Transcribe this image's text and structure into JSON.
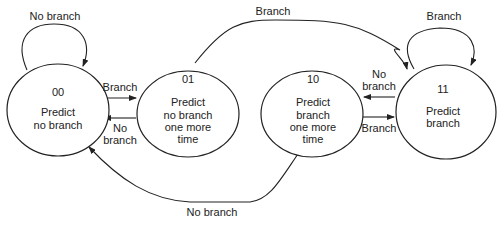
{
  "diagram": {
    "states": [
      {
        "id": "s00",
        "code": "00",
        "lines": [
          "Predict",
          "no branch"
        ]
      },
      {
        "id": "s01",
        "code": "01",
        "lines": [
          "Predict",
          "no branch",
          "one more",
          "time"
        ]
      },
      {
        "id": "s10",
        "code": "10",
        "lines": [
          "Predict",
          "branch",
          "one more",
          "time"
        ]
      },
      {
        "id": "s11",
        "code": "11",
        "lines": [
          "Predict",
          "branch"
        ]
      }
    ],
    "transitions": [
      {
        "from": "00",
        "to": "00",
        "label": "No branch"
      },
      {
        "from": "00",
        "to": "01",
        "label": "Branch"
      },
      {
        "from": "01",
        "to": "00",
        "label_lines": [
          "No",
          "branch"
        ]
      },
      {
        "from": "01",
        "to": "11",
        "label": "Branch"
      },
      {
        "from": "11",
        "to": "11",
        "label": "Branch"
      },
      {
        "from": "11",
        "to": "10",
        "label_lines": [
          "No",
          "branch"
        ]
      },
      {
        "from": "10",
        "to": "11",
        "label": "Branch"
      },
      {
        "from": "10",
        "to": "00",
        "label": "No branch"
      }
    ]
  }
}
